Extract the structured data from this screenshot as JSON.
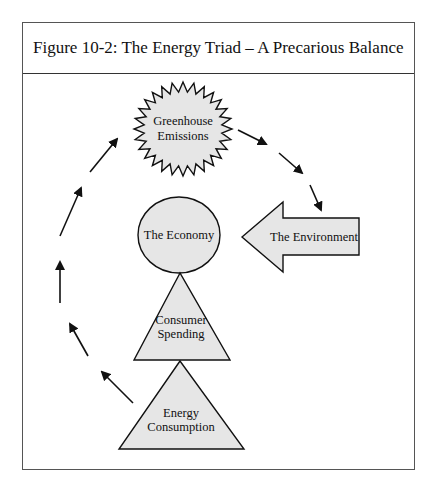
{
  "figure": {
    "clipped_previous_line": "",
    "title": "Figure 10-2:  The Energy Triad – A Precarious Balance"
  },
  "nodes": {
    "greenhouse": {
      "line1": "Greenhouse",
      "line2": "Emissions",
      "shape": "starburst"
    },
    "economy": {
      "label": "The Economy",
      "shape": "circle"
    },
    "environment": {
      "label": "The Environment",
      "shape": "left-arrow"
    },
    "spending": {
      "line1": "Consumer",
      "line2": "Spending",
      "shape": "triangle"
    },
    "consumption": {
      "line1": "Energy",
      "line2": "Consumption",
      "shape": "triangle"
    }
  },
  "flows": [
    {
      "from": "consumption",
      "to": "greenhouse",
      "path": "left-arc",
      "arrows": 5
    },
    {
      "from": "greenhouse",
      "to": "environment",
      "path": "right-descent",
      "arrows": 2
    },
    {
      "from": "environment",
      "to": "economy",
      "path": "block-arrow"
    }
  ],
  "colors": {
    "shape_fill": "#e6e6e6",
    "stroke": "#111111",
    "frame_border": "#555555"
  }
}
